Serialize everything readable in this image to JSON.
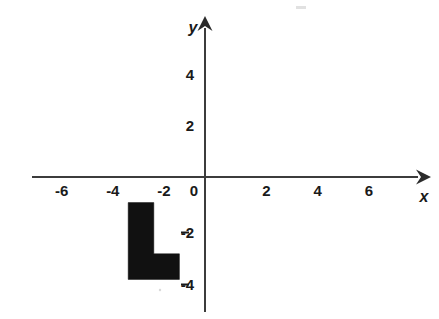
{
  "figure": {
    "title": "",
    "background_color": "#ffffff"
  },
  "chart_data": {
    "type": "scatter",
    "title": "",
    "subtitle": "",
    "xlabel": "x",
    "ylabel": "y",
    "xlim": [
      -7,
      7
    ],
    "ylim": [
      -5,
      5
    ],
    "grid": true,
    "grid_step": 1,
    "legend": null,
    "legend_position": "none",
    "x_tick_labels": [
      "-6",
      "-4",
      "-2",
      "0",
      "2",
      "4",
      "6"
    ],
    "x_tick_values": [
      -6,
      -4,
      -2,
      0,
      2,
      4,
      6
    ],
    "y_tick_labels": [
      "4",
      "2",
      "0",
      "-2",
      "-4"
    ],
    "y_tick_values": [
      4,
      2,
      0,
      -2,
      -4
    ],
    "series": [
      {
        "name": "L-shaped figure",
        "type": "polygon",
        "fill_color": "#111111",
        "vertices": [
          [
            -3,
            -1
          ],
          [
            -2,
            -1
          ],
          [
            -2,
            -3
          ],
          [
            -1,
            -3
          ],
          [
            -1,
            -4
          ],
          [
            -3,
            -4
          ]
        ],
        "quadrant": "III",
        "area_square_units": 4
      }
    ],
    "annotations": []
  },
  "axes": {
    "x_axis_name": "x",
    "y_axis_name": "y",
    "axis_color": "#3c3c3c",
    "grid_color": "#b9b9b9",
    "x_arrow": "right-arrowhead",
    "y_arrow": "up-arrowhead"
  },
  "ticks": {
    "x": [
      {
        "label": "-6",
        "value": -6
      },
      {
        "label": "-4",
        "value": -4
      },
      {
        "label": "-2",
        "value": -2
      },
      {
        "label": "0",
        "value": 0
      },
      {
        "label": "2",
        "value": 2
      },
      {
        "label": "4",
        "value": 4
      },
      {
        "label": "6",
        "value": 6
      }
    ],
    "y": [
      {
        "label": "4",
        "value": 4
      },
      {
        "label": "2",
        "value": 2
      },
      {
        "label": "0",
        "value": 0
      },
      {
        "label": "-2",
        "value": -2
      },
      {
        "label": "-4",
        "value": -4
      }
    ]
  }
}
